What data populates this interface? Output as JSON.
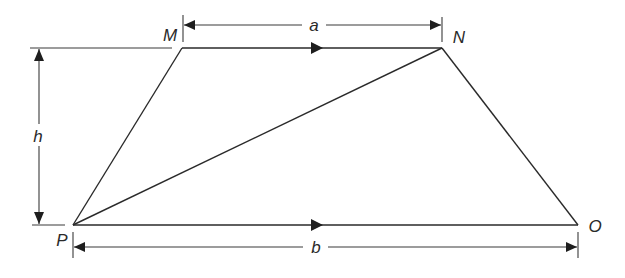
{
  "diagram": {
    "colors": {
      "stroke": "#2a2a2a",
      "background": "#ffffff"
    },
    "vertices": {
      "M": {
        "label": "M",
        "x": 182,
        "y": 48
      },
      "N": {
        "label": "N",
        "x": 442,
        "y": 48
      },
      "O": {
        "label": "O",
        "x": 578,
        "y": 225
      },
      "P": {
        "label": "P",
        "x": 73,
        "y": 225
      }
    },
    "edges": [
      {
        "from": "M",
        "to": "N",
        "arrow": "forward"
      },
      {
        "from": "P",
        "to": "O",
        "arrow": "forward"
      },
      {
        "from": "P",
        "to": "M",
        "arrow": "none"
      },
      {
        "from": "N",
        "to": "O",
        "arrow": "none"
      },
      {
        "from": "P",
        "to": "N",
        "arrow": "none",
        "note": "diagonal"
      }
    ],
    "dimensions": {
      "a": {
        "label": "a",
        "description": "length of top side MN"
      },
      "b": {
        "label": "b",
        "description": "length of bottom side PO"
      },
      "h": {
        "label": "h",
        "description": "perpendicular height between parallel sides"
      }
    }
  }
}
